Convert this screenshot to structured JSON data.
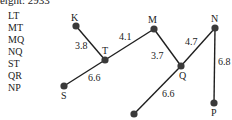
{
  "title": "weight: 2933",
  "edge_list": [
    "LT",
    "MT",
    "MQ",
    "NQ",
    "ST",
    "QR",
    "NP"
  ],
  "colors": {
    "node": "#3a3a3a",
    "edge": "#1f1f1f",
    "text": "#222222"
  },
  "nodes": [
    {
      "id": "K",
      "label": "K",
      "x": 76,
      "y": 26
    },
    {
      "id": "T",
      "label": "T",
      "x": 105,
      "y": 60
    },
    {
      "id": "M",
      "label": "M",
      "x": 154,
      "y": 29
    },
    {
      "id": "Q",
      "label": "Q",
      "x": 181,
      "y": 66
    },
    {
      "id": "N",
      "label": "N",
      "x": 215,
      "y": 28
    },
    {
      "id": "P",
      "label": "P",
      "x": 214,
      "y": 103
    },
    {
      "id": "S",
      "label": "S",
      "x": 64,
      "y": 86
    },
    {
      "id": "R",
      "label": "",
      "x": 134,
      "y": 114
    }
  ],
  "edges": [
    {
      "from": "K",
      "to": "T",
      "weight": "3.8"
    },
    {
      "from": "T",
      "to": "M",
      "weight": "4.1"
    },
    {
      "from": "M",
      "to": "Q",
      "weight": "3.7"
    },
    {
      "from": "Q",
      "to": "N",
      "weight": "4.7"
    },
    {
      "from": "N",
      "to": "P",
      "weight": "6.8"
    },
    {
      "from": "T",
      "to": "S",
      "weight": "6.6"
    },
    {
      "from": "Q",
      "to": "R",
      "weight": "6.6"
    }
  ]
}
